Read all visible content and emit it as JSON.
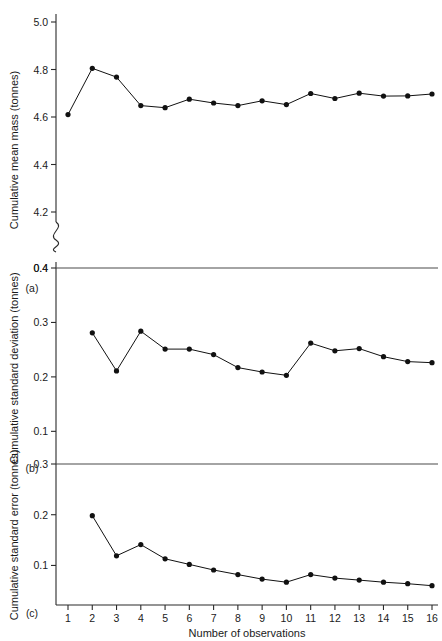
{
  "figure": {
    "xlabel": "Number of observations",
    "x_ticks": [
      "1",
      "2",
      "3",
      "4",
      "5",
      "6",
      "7",
      "8",
      "9",
      "10",
      "11",
      "12",
      "13",
      "14",
      "15",
      "16"
    ],
    "panel_labels": {
      "a": "(a)",
      "b": "(b)",
      "c": "(c)"
    }
  },
  "chart_data": [
    {
      "type": "line",
      "panel": "(a)",
      "title": "",
      "xlabel": "Number of observations",
      "ylabel": "Cumulative mean mass (tonnes)",
      "x": [
        2,
        3,
        4,
        5,
        6,
        7,
        8,
        9,
        10,
        11,
        12,
        13,
        14,
        15,
        16
      ],
      "values": [
        4.61,
        4.805,
        4.768,
        4.648,
        4.639,
        4.675,
        4.659,
        4.648,
        4.668,
        4.652,
        4.699,
        4.678,
        4.7,
        4.688,
        4.689,
        4.697
      ],
      "series": [
        {
          "name": "Cumulative mean mass",
          "x": [
            1,
            2,
            3,
            4,
            5,
            6,
            7,
            8,
            9,
            10,
            11,
            12,
            13,
            14,
            15,
            16
          ],
          "values": [
            4.61,
            4.805,
            4.768,
            4.648,
            4.639,
            4.675,
            4.659,
            4.648,
            4.668,
            4.652,
            4.699,
            4.678,
            4.7,
            4.688,
            4.689,
            4.697
          ]
        }
      ],
      "y_ticks": [
        "5.0",
        "4.8",
        "4.6",
        "4.4",
        "4.2",
        "0.4"
      ],
      "y_tick_values": [
        5.0,
        4.8,
        4.6,
        4.4,
        4.2,
        0.4
      ],
      "ylim": [
        4.1,
        5.05
      ],
      "axis_break": true,
      "grid": false,
      "legend": "none",
      "marker": "filled-circle"
    },
    {
      "type": "line",
      "panel": "(b)",
      "title": "",
      "xlabel": "Number of observations",
      "ylabel": "Cumulative standard deviation (tonnes)",
      "x": [
        2,
        3,
        4,
        5,
        6,
        7,
        8,
        9,
        10,
        11,
        12,
        13,
        14,
        15,
        16
      ],
      "values": [
        0.281,
        0.211,
        0.284,
        0.251,
        0.251,
        0.241,
        0.217,
        0.209,
        0.203,
        0.262,
        0.248,
        0.252,
        0.237,
        0.228,
        0.226
      ],
      "series": [
        {
          "name": "Cumulative standard deviation",
          "x": [
            2,
            3,
            4,
            5,
            6,
            7,
            8,
            9,
            10,
            11,
            12,
            13,
            14,
            15,
            16
          ],
          "values": [
            0.281,
            0.211,
            0.284,
            0.251,
            0.251,
            0.241,
            0.217,
            0.209,
            0.203,
            0.262,
            0.248,
            0.252,
            0.237,
            0.228,
            0.226
          ]
        }
      ],
      "y_ticks": [
        "0.4",
        "0.3",
        "0.2",
        "0.1"
      ],
      "y_tick_values": [
        0.4,
        0.3,
        0.2,
        0.1
      ],
      "ylim": [
        0.04,
        0.4
      ],
      "grid": false,
      "legend": "none",
      "marker": "filled-circle"
    },
    {
      "type": "line",
      "panel": "(c)",
      "title": "",
      "xlabel": "Number of observations",
      "ylabel": "Cumulative standard error (tonnes)",
      "x": [
        2,
        3,
        4,
        5,
        6,
        7,
        8,
        9,
        10,
        11,
        12,
        13,
        14,
        15,
        16
      ],
      "values": [
        0.198,
        0.119,
        0.141,
        0.113,
        0.102,
        0.091,
        0.082,
        0.073,
        0.067,
        0.082,
        0.075,
        0.071,
        0.067,
        0.064,
        0.06
      ],
      "series": [
        {
          "name": "Cumulative standard error",
          "x": [
            2,
            3,
            4,
            5,
            6,
            7,
            8,
            9,
            10,
            11,
            12,
            13,
            14,
            15,
            16
          ],
          "values": [
            0.198,
            0.119,
            0.141,
            0.113,
            0.102,
            0.091,
            0.082,
            0.073,
            0.067,
            0.082,
            0.075,
            0.071,
            0.067,
            0.064,
            0.06
          ]
        }
      ],
      "y_ticks": [
        "0.3",
        "0.2",
        "0.1"
      ],
      "y_tick_values": [
        0.3,
        0.2,
        0.1
      ],
      "ylim": [
        0.022,
        0.3
      ],
      "grid": false,
      "legend": "none",
      "marker": "filled-circle"
    }
  ]
}
